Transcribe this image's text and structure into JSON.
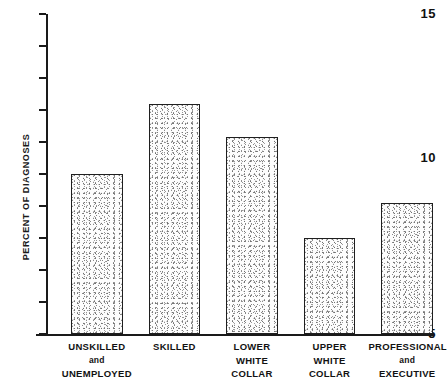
{
  "chart_data": {
    "type": "bar",
    "title": "",
    "xlabel": "",
    "ylabel": "PERCENT OF DIAGNOSES",
    "ylim": [
      5,
      15
    ],
    "ytick_labels": [
      "15",
      "5"
    ],
    "ytick_values": [
      15,
      14,
      13,
      12,
      11,
      10,
      9,
      8,
      7,
      6,
      5
    ],
    "grid": false,
    "legend": "none",
    "categories": [
      "UNSKILLED and UNEMPLOYED",
      "SKILLED",
      "LOWER WHITE COLLAR",
      "UPPER WHITE COLLAR",
      "PROFESSIONAL and EXECUTIVE"
    ],
    "values": [
      10.0,
      12.2,
      11.15,
      8.0,
      9.1
    ]
  },
  "axis": {
    "y_label": "PERCENT OF DIAGNOSES",
    "y_top_label": "15",
    "y_mid_label": "10",
    "y_bottom_label": "5"
  },
  "categories": [
    {
      "line1": "UNSKILLED",
      "line2": "and",
      "line3": "UNEMPLOYED"
    },
    {
      "line1": "SKILLED",
      "line2": "",
      "line3": ""
    },
    {
      "line1": "LOWER",
      "line2": "WHITE",
      "line3": "COLLAR"
    },
    {
      "line1": "UPPER",
      "line2": "WHITE",
      "line3": "COLLAR"
    },
    {
      "line1": "PROFESSIONAL",
      "line2": "and",
      "line3": "EXECUTIVE"
    }
  ],
  "colors": {
    "ink": "#1a1a1a",
    "bar_outline": "#1f1f1f",
    "bar_fill": "#e8e8e8",
    "background": "#ffffff"
  }
}
